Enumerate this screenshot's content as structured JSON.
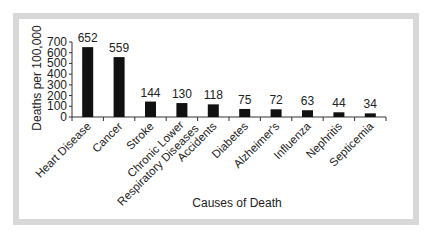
{
  "chart_data": {
    "type": "bar",
    "title": "",
    "xlabel": "Causes of Death",
    "ylabel": "Deaths per 100,000",
    "ylim": [
      0,
      700
    ],
    "yticks": [
      0,
      100,
      200,
      300,
      400,
      500,
      600,
      700
    ],
    "grid": false,
    "legend": null,
    "categories": [
      "Heart Disease",
      "Cancer",
      "Stroke",
      "Chronic Lower Respiratory Diseases",
      "Accidents",
      "Diabetes",
      "Alzheimer's",
      "Influenza",
      "Nephritis",
      "Septicemia"
    ],
    "category_lines": [
      [
        "Heart Disease"
      ],
      [
        "Cancer"
      ],
      [
        "Stroke"
      ],
      [
        "Chronic Lower",
        "Respiratory Diseases"
      ],
      [
        "Accidents"
      ],
      [
        "Diabetes"
      ],
      [
        "Alzheimer's"
      ],
      [
        "Influenza"
      ],
      [
        "Nephritis"
      ],
      [
        "Septicemia"
      ]
    ],
    "values": [
      652,
      559,
      144,
      130,
      118,
      75,
      72,
      63,
      44,
      34
    ],
    "data_labels": [
      "652",
      "559",
      "144",
      "130",
      "118",
      "75",
      "72",
      "63",
      "44",
      "34"
    ],
    "bar_color": "#111111"
  },
  "colors": {
    "frame": "#d8d8d8",
    "background": "#ffffff",
    "bar": "#111111",
    "axis": "#333333"
  }
}
